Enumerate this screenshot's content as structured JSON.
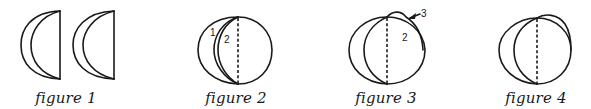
{
  "figures": [
    {
      "id": 1,
      "caption": "figure 1",
      "labels": []
    },
    {
      "id": 2,
      "caption": "figure 2",
      "labels": [
        "1",
        "2"
      ]
    },
    {
      "id": 3,
      "caption": "figure 3",
      "labels": [
        "3",
        "2"
      ]
    },
    {
      "id": 4,
      "caption": "figure 4",
      "labels": []
    }
  ],
  "colors": {
    "stroke": "#1a1a1a",
    "background": "#ffffff"
  }
}
